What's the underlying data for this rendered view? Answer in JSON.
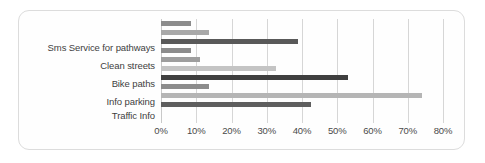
{
  "chart_data": {
    "type": "bar",
    "orientation": "horizontal",
    "title": "",
    "xlabel": "",
    "ylabel": "",
    "xlim": [
      0,
      80
    ],
    "grid": true,
    "legend": "none",
    "tick_labels": [
      "0%",
      "10%",
      "20%",
      "30%",
      "40%",
      "50%",
      "60%",
      "70%",
      "80%"
    ],
    "tick_values": [
      0,
      10,
      20,
      30,
      40,
      50,
      60,
      70,
      80
    ],
    "categories": [
      "Sms Service for pathways",
      "Clean streets",
      "Bike paths",
      "Info parking",
      "Traffic Info"
    ],
    "series": [
      {
        "name": "Series 1",
        "color": "#808080",
        "values": [
          8.5,
          8.5,
          11.0,
          13.5,
          42.5
        ]
      },
      {
        "name": "Series 2",
        "color": "#a6a6a6",
        "values": [
          13.5,
          11.0,
          32.5,
          74.0,
          53.0
        ]
      },
      {
        "name": "Series 3",
        "color": "#4d4d4d",
        "values": [
          39.0,
          32.5,
          53.0,
          42.5,
          8.5
        ]
      }
    ],
    "bars": [
      {
        "category": "Sms Service for pathways",
        "value": 8.5,
        "color": "#8c8c8c"
      },
      {
        "category": "Sms Service for pathways",
        "value": 13.5,
        "color": "#a8a8a8"
      },
      {
        "category": "Sms Service for pathways",
        "value": 39.0,
        "color": "#595959"
      },
      {
        "category": "Clean streets",
        "value": 8.5,
        "color": "#8c8c8c"
      },
      {
        "category": "Clean streets",
        "value": 11.0,
        "color": "#9e9e9e"
      },
      {
        "category": "Clean streets",
        "value": 32.5,
        "color": "#c4c4c4"
      },
      {
        "category": "Bike paths",
        "value": 53.0,
        "color": "#3f3f3f"
      },
      {
        "category": "Bike paths",
        "value": 13.5,
        "color": "#8c8c8c"
      },
      {
        "category": "Bike paths",
        "value": 74.0,
        "color": "#b5b5b5"
      },
      {
        "category": "Info parking",
        "value": 42.5,
        "color": "#6e6e6e"
      },
      {
        "category": "Info parking",
        "value": 8.5,
        "color": "#8c8c8c"
      },
      {
        "category": "Info parking",
        "value": 13.5,
        "color": "#a8a8a8"
      },
      {
        "category": "Traffic Info",
        "value": 42.5,
        "color": "#5e5e5e"
      }
    ]
  },
  "layout": {
    "bar_slots": [
      {
        "value": 8.5,
        "color": "#8c8c8c",
        "top": 2
      },
      {
        "value": 13.5,
        "color": "#a8a8a8",
        "top": 11
      },
      {
        "value": 39.0,
        "color": "#595959",
        "top": 20
      },
      {
        "value": 8.5,
        "color": "#8c8c8c",
        "top": 29
      },
      {
        "value": 11.0,
        "color": "#9e9e9e",
        "top": 38
      },
      {
        "value": 32.5,
        "color": "#c4c4c4",
        "top": 47
      },
      {
        "value": 53.0,
        "color": "#3f3f3f",
        "top": 56
      },
      {
        "value": 13.5,
        "color": "#8c8c8c",
        "top": 65
      },
      {
        "value": 74.0,
        "color": "#b5b5b5",
        "top": 74
      },
      {
        "value": 42.5,
        "color": "#5e5e5e",
        "top": 83
      }
    ],
    "label_tops": [
      24,
      42,
      60,
      78,
      92
    ]
  }
}
